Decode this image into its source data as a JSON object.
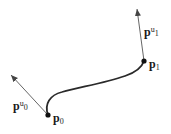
{
  "diagram": {
    "type": "hermite-curve",
    "colors": {
      "curve": "#2a2a2a",
      "arrow": "#555555",
      "point": "#111111"
    },
    "points": [
      {
        "id": "p0",
        "base": "p",
        "sub": "0",
        "x": 48,
        "y": 115
      },
      {
        "id": "p1",
        "base": "p",
        "sub": "1",
        "x": 144,
        "y": 61
      }
    ],
    "tangents": [
      {
        "id": "pu0",
        "base": "p",
        "sup": "u",
        "sub": "0",
        "from": [
          48,
          115
        ],
        "to": [
          11,
          75
        ]
      },
      {
        "id": "pu1",
        "base": "p",
        "sup": "u",
        "sub": "1",
        "from": [
          144,
          61
        ],
        "to": [
          137,
          9
        ]
      }
    ],
    "labels": {
      "p0": {
        "base": "p",
        "sub": "0"
      },
      "p1": {
        "base": "p",
        "sub": "1"
      },
      "pu0": {
        "base": "p",
        "sup": "u",
        "sub": "0"
      },
      "pu1": {
        "base": "p",
        "sup": "u",
        "sub": "1"
      }
    }
  }
}
